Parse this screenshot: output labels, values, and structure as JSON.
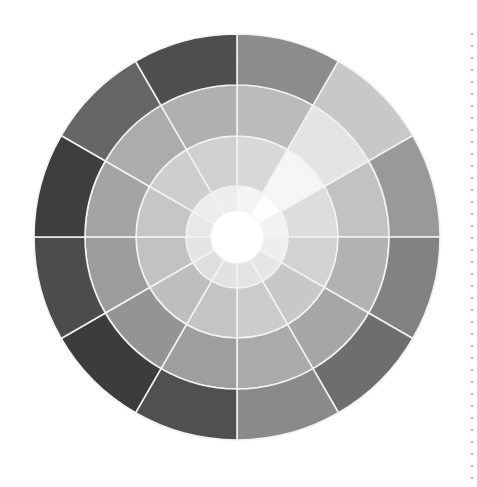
{
  "wheel": {
    "center": [
      237,
      237
    ],
    "segments": 12,
    "start_angle_deg": 0,
    "ring_radii": [
      26,
      51,
      101,
      152,
      203
    ],
    "separator_color": "#f2f2f2",
    "hub_color": "#ffffff",
    "rings": [
      {
        "name": "inner",
        "colors": [
          "#f4f4f4",
          "#fdfdfd",
          "#f2f2f2",
          "#eeeeee",
          "#e6e6e6",
          "#e4e4e4",
          "#e2e2e2",
          "#dedede",
          "#e4e4e4",
          "#e8e8e8",
          "#ececec",
          "#eeeeee"
        ]
      },
      {
        "name": "second",
        "colors": [
          "#d8d8d8",
          "#f6f6f6",
          "#dcdcdc",
          "#d2d2d2",
          "#c8c8c8",
          "#cccccc",
          "#c4c4c4",
          "#bebebe",
          "#c2c2c2",
          "#c6c6c6",
          "#cecece",
          "#d0d0d0"
        ]
      },
      {
        "name": "third",
        "colors": [
          "#bbbbbb",
          "#e4e4e4",
          "#c2c2c2",
          "#b2b2b2",
          "#a6a6a6",
          "#aaaaaa",
          "#9e9e9e",
          "#949494",
          "#9c9c9c",
          "#a4a4a4",
          "#acacac",
          "#b0b0b0"
        ]
      },
      {
        "name": "outer",
        "colors": [
          "#8c8c8c",
          "#c8c8c8",
          "#999999",
          "#828282",
          "#6e6e6e",
          "#8a8a8a",
          "#505050",
          "#3c3c3c",
          "#4c4c4c",
          "#3e3e3e",
          "#666666",
          "#4e4e4e"
        ]
      }
    ]
  },
  "divider": {
    "style": "dotted",
    "color": "#b8b8b8"
  }
}
